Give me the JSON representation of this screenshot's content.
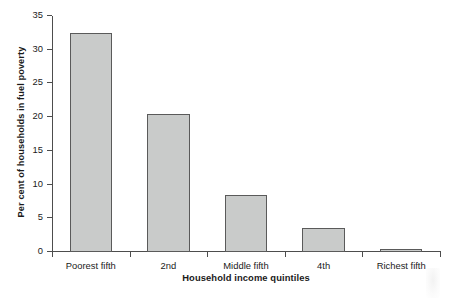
{
  "chart_data": {
    "type": "bar",
    "title": "",
    "xlabel": "Household income quintiles",
    "ylabel": "Per cent of households in fuel poverty",
    "categories": [
      "Poorest fifth",
      "2nd",
      "Middle fifth",
      "4th",
      "Richest fifth"
    ],
    "values": [
      32.5,
      20.5,
      8.5,
      3.5,
      0.5
    ],
    "ylim": [
      0,
      35
    ],
    "ytick_values": [
      0,
      5,
      10,
      15,
      20,
      25,
      30,
      35
    ],
    "ytick_labels": [
      "0",
      "5",
      "10",
      "15",
      "20",
      "25",
      "30",
      "35"
    ],
    "grid": false,
    "legend": "none",
    "bar_fill_color": "#c9cbca",
    "bar_border_color": "#5a5a5a",
    "axis_color": "#4d4d4d",
    "background_color": "#ffffff"
  }
}
